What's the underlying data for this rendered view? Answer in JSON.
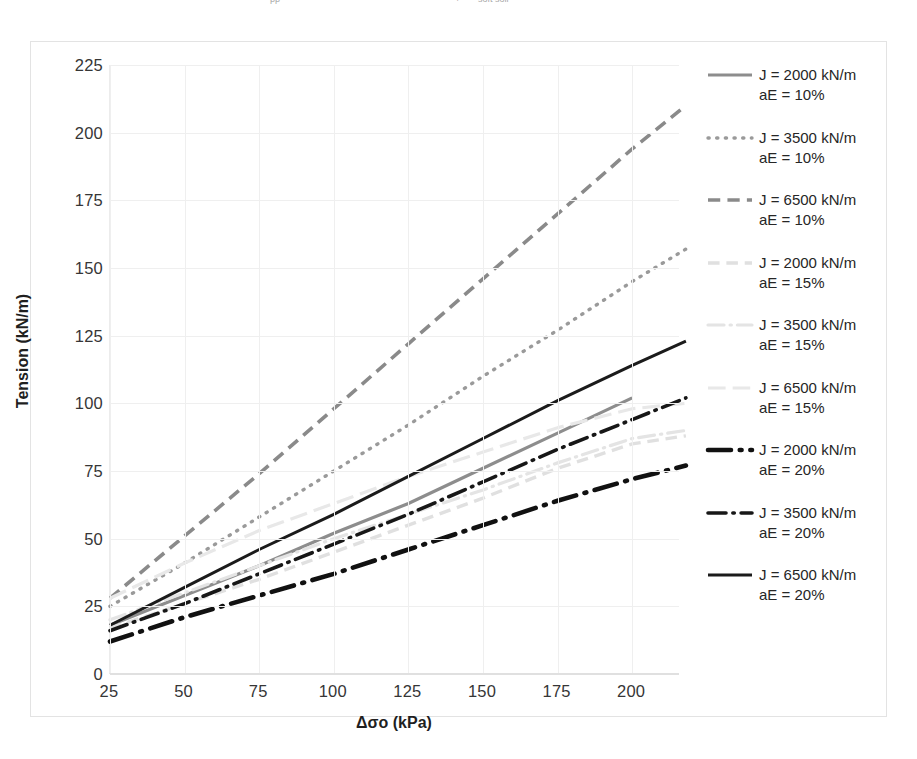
{
  "top_fragment": {
    "left_text": "pp",
    "right_text": "soft soil"
  },
  "axes": {
    "y_title": "Tension (kN/m)",
    "x_title": "Δσo (kPa)",
    "y_ticks": [
      "225",
      "200",
      "175",
      "150",
      "125",
      "100",
      "75",
      "50",
      "25",
      "0"
    ],
    "x_ticks": [
      "25",
      "50",
      "75",
      "100",
      "125",
      "150",
      "175",
      "200"
    ]
  },
  "legend": {
    "items": [
      {
        "line1": "J = 2000 kN/m",
        "line2": "aE = 10%",
        "style": "solid",
        "color": "#8d8d8d",
        "width": 3.2
      },
      {
        "line1": "J = 3500 kN/m",
        "line2": "aE = 10%",
        "style": "dotted",
        "color": "#9a9a9a",
        "width": 3.4
      },
      {
        "line1": "J = 6500 kN/m",
        "line2": "aE = 10%",
        "style": "dashed",
        "color": "#8a8a8a",
        "width": 3.6
      },
      {
        "line1": "J = 2000 kN/m",
        "line2": "aE = 15%",
        "style": "dashed",
        "color": "#e0e0e0",
        "width": 3.4
      },
      {
        "line1": "J = 3500 kN/m",
        "line2": "aE = 15%",
        "style": "dashdot",
        "color": "#e4e4e4",
        "width": 3.2
      },
      {
        "line1": "J = 6500 kN/m",
        "line2": "aE = 15%",
        "style": "longdash",
        "color": "#e8e8e8",
        "width": 3.2
      },
      {
        "line1": "J = 2000 kN/m",
        "line2": "aE = 20%",
        "style": "dashdot",
        "color": "#111111",
        "width": 4.6
      },
      {
        "line1": "J = 3500 kN/m",
        "line2": "aE = 20%",
        "style": "dashdot",
        "color": "#171717",
        "width": 3.6
      },
      {
        "line1": "J = 6500 kN/m",
        "line2": "aE = 20%",
        "style": "solid",
        "color": "#1b1b1b",
        "width": 3.0
      }
    ]
  },
  "chart_data": {
    "type": "line",
    "title": "",
    "xlabel": "Δσo (kPa)",
    "ylabel": "Tension (kN/m)",
    "xlim": [
      25,
      218
    ],
    "ylim": [
      0,
      225
    ],
    "xticks": [
      25,
      50,
      75,
      100,
      125,
      150,
      175,
      200
    ],
    "yticks": [
      0,
      25,
      50,
      75,
      100,
      125,
      150,
      175,
      200,
      225
    ],
    "grid": true,
    "legend_position": "right",
    "series": [
      {
        "name": "J = 2000 kN/m, aE = 10%",
        "style": "solid",
        "color": "#8d8d8d",
        "width": 3.2,
        "x": [
          25,
          50,
          75,
          100,
          125,
          150,
          175,
          200
        ],
        "y": [
          18,
          29,
          40,
          52,
          63,
          76,
          89,
          102
        ]
      },
      {
        "name": "J = 3500 kN/m, aE = 10%",
        "style": "dotted",
        "color": "#9a9a9a",
        "width": 3.4,
        "x": [
          25,
          50,
          75,
          100,
          125,
          150,
          175,
          200,
          218
        ],
        "y": [
          25,
          41,
          58,
          75,
          92,
          110,
          127,
          145,
          157
        ]
      },
      {
        "name": "J = 6500 kN/m, aE = 10%",
        "style": "dashed",
        "color": "#8a8a8a",
        "width": 3.6,
        "x": [
          25,
          50,
          75,
          100,
          125,
          150,
          175,
          200,
          218
        ],
        "y": [
          28,
          51,
          74,
          98,
          122,
          146,
          170,
          194,
          210
        ]
      },
      {
        "name": "J = 2000 kN/m, aE = 15%",
        "style": "dashed",
        "color": "#e0e0e0",
        "width": 3.4,
        "x": [
          25,
          50,
          75,
          100,
          125,
          150,
          175,
          200,
          218
        ],
        "y": [
          17,
          26,
          35,
          45,
          55,
          65,
          76,
          85,
          88
        ]
      },
      {
        "name": "J = 3500 kN/m, aE = 15%",
        "style": "dashdot",
        "color": "#e4e4e4",
        "width": 3.2,
        "x": [
          25,
          50,
          75,
          100,
          125,
          150,
          175,
          200,
          218
        ],
        "y": [
          20,
          30,
          40,
          50,
          59,
          68,
          78,
          87,
          90
        ]
      },
      {
        "name": "J = 6500 kN/m, aE = 15%",
        "style": "longdash",
        "color": "#e8e8e8",
        "width": 3.2,
        "x": [
          25,
          50,
          75,
          100,
          125,
          150,
          175,
          200,
          218
        ],
        "y": [
          28,
          41,
          53,
          63,
          73,
          82,
          91,
          98,
          100
        ]
      },
      {
        "name": "J = 2000 kN/m, aE = 20%",
        "style": "dashdot",
        "color": "#111111",
        "width": 4.6,
        "x": [
          25,
          50,
          75,
          100,
          125,
          150,
          175,
          200,
          218
        ],
        "y": [
          12,
          21,
          29,
          37,
          46,
          55,
          64,
          72,
          77
        ]
      },
      {
        "name": "J = 3500 kN/m, aE = 20%",
        "style": "dashdot",
        "color": "#171717",
        "width": 3.6,
        "x": [
          25,
          50,
          75,
          100,
          125,
          150,
          175,
          200,
          218
        ],
        "y": [
          16,
          26,
          37,
          48,
          59,
          71,
          83,
          94,
          102
        ]
      },
      {
        "name": "J = 6500 kN/m, aE = 20%",
        "style": "solid",
        "color": "#1b1b1b",
        "width": 3.0,
        "x": [
          25,
          50,
          75,
          100,
          125,
          150,
          175,
          200,
          218
        ],
        "y": [
          18,
          32,
          46,
          59,
          73,
          87,
          101,
          114,
          123
        ]
      }
    ]
  }
}
